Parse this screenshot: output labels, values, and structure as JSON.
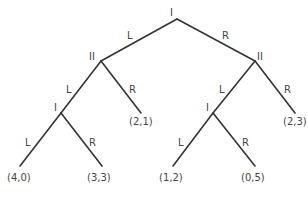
{
  "diagram": {
    "type": "game-tree",
    "nodes": {
      "root": {
        "player": "I",
        "x": 177,
        "y": 19
      },
      "left_ii": {
        "player": "II",
        "x": 101,
        "y": 61
      },
      "right_ii": {
        "player": "II",
        "x": 255,
        "y": 61
      },
      "left_i": {
        "player": "I",
        "x": 61,
        "y": 113
      },
      "right_i": {
        "player": "I",
        "x": 213,
        "y": 113
      }
    },
    "edges": {
      "root_l": {
        "label": "L"
      },
      "root_r": {
        "label": "R"
      },
      "left_ii_l": {
        "label": "L"
      },
      "left_ii_r": {
        "label": "R"
      },
      "right_ii_l": {
        "label": "L"
      },
      "right_ii_r": {
        "label": "R"
      },
      "left_i_l": {
        "label": "L"
      },
      "left_i_r": {
        "label": "R"
      },
      "right_i_l": {
        "label": "L"
      },
      "right_i_r": {
        "label": "R"
      }
    },
    "payoffs": {
      "p1": "(4,0)",
      "p2": "(3,3)",
      "p3": "(2,1)",
      "p4": "(1,2)",
      "p5": "(0,5)",
      "p6": "(2,3)"
    }
  }
}
